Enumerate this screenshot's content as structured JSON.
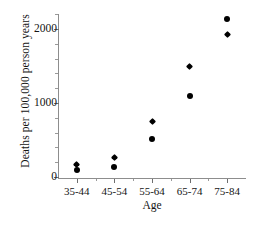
{
  "chart_data": {
    "type": "scatter",
    "title": "",
    "xlabel": "Age",
    "ylabel": "Deaths per 100,000 person years",
    "categories": [
      "35-44",
      "45-54",
      "55-64",
      "65-74",
      "75-84"
    ],
    "ylim": [
      0,
      2230
    ],
    "yticks": [
      0,
      1000,
      2000
    ],
    "ytick_labels": [
      "0",
      "1000",
      "2000"
    ],
    "grid": false,
    "legend": false,
    "series": [
      {
        "name": "upper",
        "values": [
          170,
          260,
          750,
          1490,
          2130
        ]
      },
      {
        "name": "lower",
        "values": [
          100,
          140,
          510,
          1100,
          1930
        ]
      }
    ],
    "points": [
      {
        "category": "35-44",
        "value": 170,
        "marker": "diamond"
      },
      {
        "category": "35-44",
        "value": 100,
        "marker": "circle"
      },
      {
        "category": "45-54",
        "value": 260,
        "marker": "diamond"
      },
      {
        "category": "45-54",
        "value": 140,
        "marker": "circle"
      },
      {
        "category": "55-64",
        "value": 750,
        "marker": "diamond"
      },
      {
        "category": "55-64",
        "value": 510,
        "marker": "circle"
      },
      {
        "category": "65-74",
        "value": 1490,
        "marker": "diamond"
      },
      {
        "category": "65-74",
        "value": 1100,
        "marker": "circle"
      },
      {
        "category": "75-84",
        "value": 2130,
        "marker": "circle"
      },
      {
        "category": "75-84",
        "value": 1930,
        "marker": "diamond"
      }
    ],
    "colors": {
      "marker": "#000000",
      "axis": "#8d8d8d",
      "text": "#141414",
      "background": "#ffffff"
    }
  }
}
